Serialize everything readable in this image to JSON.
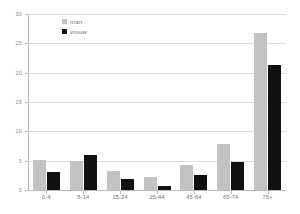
{
  "chart_data": {
    "type": "bar",
    "title": "",
    "subtitle": "",
    "xlabel": "",
    "ylabel": "",
    "categories": [
      "0-4",
      "5-14",
      "15-24",
      "25-44",
      "45-64",
      "65-74",
      "75+"
    ],
    "series": [
      {
        "name": "man",
        "color": "#c2c2c2",
        "values": [
          5.1,
          5.0,
          3.2,
          2.3,
          4.2,
          7.9,
          26.8
        ]
      },
      {
        "name": "vrouw",
        "color": "#111111",
        "values": [
          3.0,
          5.9,
          1.9,
          0.7,
          2.5,
          4.8,
          21.3
        ]
      }
    ],
    "ylim": [
      0,
      30
    ],
    "yticks": [
      0,
      5,
      10,
      15,
      20,
      25,
      30
    ],
    "ytick_labels": [
      "0",
      "5",
      "10",
      "15",
      "20",
      "25",
      "30"
    ],
    "grid": true,
    "grid_axis": "y",
    "legend_position": "top-left"
  },
  "legend": {
    "items": [
      {
        "label": "man"
      },
      {
        "label": "vrouw"
      }
    ]
  },
  "colors": {
    "man": "#c2c2c2",
    "vrouw": "#111111",
    "grid": "#dcdcdc",
    "axis": "#b9b9b9",
    "tick_text": "#8a8a8a",
    "label_text": "#6f6f6f",
    "background": "#ffffff"
  }
}
